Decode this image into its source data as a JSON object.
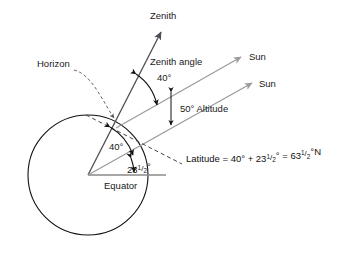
{
  "figure": {
    "labels": {
      "zenith": "Zenith",
      "zenith_angle": "Zenith angle",
      "zenith_angle_value": "40°",
      "altitude_value": "50° Altitude",
      "horizon": "Horizon",
      "sun_upper": "Sun",
      "sun_lower": "Sun",
      "equator": "Equator",
      "center_angle_upper": "40°",
      "center_angle_lower_int": "23",
      "center_angle_lower_num": "1",
      "center_angle_lower_bar": "/",
      "center_angle_lower_den": "2",
      "center_angle_lower_deg": "°"
    },
    "formula": {
      "lead": "Latitude = 40° + 23",
      "f1_num": "1",
      "f1_bar": "/",
      "f1_den": "2",
      "mid": "°  =  63",
      "f2_num": "1",
      "f2_bar": "/",
      "f2_den": "2",
      "tail": "°N",
      "plain_text": "Latitude = 40° + 23½° = 63½°N"
    },
    "colors": {
      "background": "#ffffff",
      "globe_stroke": "#111111",
      "zenith_stroke": "#4d4d55",
      "sun_ray_stroke": "#9a9a9a",
      "equator_stroke": "#8a8a8a",
      "dash_stroke": "#444444",
      "text": "#1a1a1a"
    },
    "geometry": {
      "canvas_width": 356,
      "canvas_height": 261,
      "globe_center_x": 88,
      "globe_center_y": 175,
      "globe_radius": 60,
      "zenith_angle_deg": 40,
      "solar_altitude_deg": 50,
      "latitude_deg": 63.5,
      "tropic_declination_deg": 23.5
    }
  }
}
